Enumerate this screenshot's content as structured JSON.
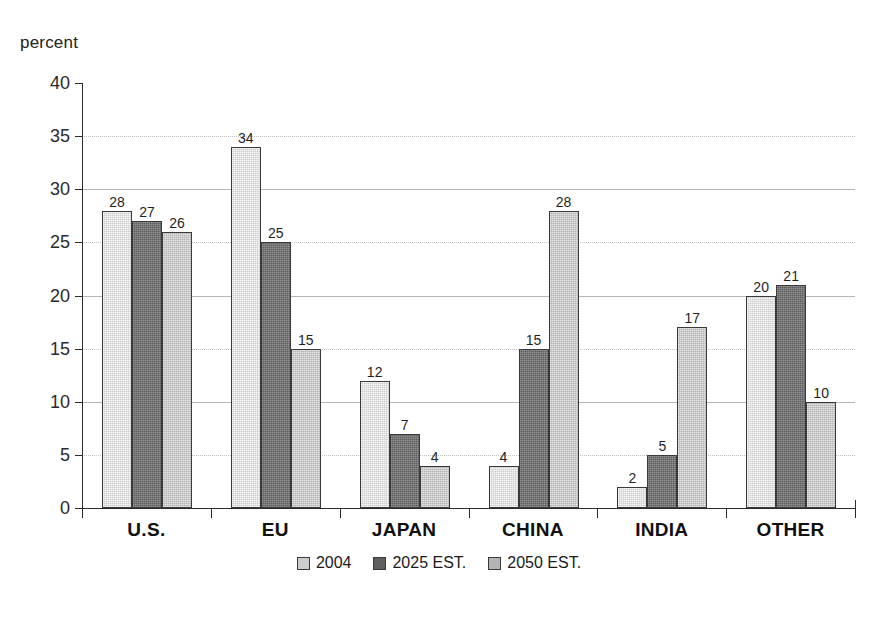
{
  "chart_data": {
    "type": "bar",
    "title": "",
    "subtitle": "",
    "xlabel": "",
    "ylabel": "percent",
    "ylim": [
      0,
      40
    ],
    "ytick_step": 5,
    "yticks": [
      "40",
      "35",
      "30",
      "25",
      "20",
      "15",
      "10",
      "5",
      "0"
    ],
    "grid": true,
    "grid_axis": "y",
    "legend_position": "bottom-center",
    "categories": [
      "U.S.",
      "EU",
      "JAPAN",
      "CHINA",
      "INDIA",
      "OTHER"
    ],
    "series": [
      {
        "name": "2004",
        "color": "#cdcdcd",
        "values": [
          28,
          34,
          12,
          4,
          2,
          20
        ]
      },
      {
        "name": "2025 EST.",
        "color": "#5f5f5f",
        "values": [
          27,
          25,
          7,
          15,
          5,
          21
        ]
      },
      {
        "name": "2050 EST.",
        "color": "#b4b4b4",
        "values": [
          26,
          15,
          4,
          28,
          17,
          10
        ]
      }
    ],
    "bar_labels": [
      [
        "28",
        "27",
        "26"
      ],
      [
        "34",
        "25",
        "15"
      ],
      [
        "12",
        "7",
        "4"
      ],
      [
        "4",
        "15",
        "28"
      ],
      [
        "2",
        "5",
        "17"
      ],
      [
        "20",
        "21",
        "10"
      ]
    ]
  },
  "axis": {
    "y_title": "percent"
  },
  "legend": {
    "items": [
      {
        "label": "2004",
        "color": "#cdcdcd"
      },
      {
        "label": "2025 EST.",
        "color": "#5f5f5f"
      },
      {
        "label": "2050 EST.",
        "color": "#b4b4b4"
      }
    ]
  },
  "artifact": {
    "bottom_smudge": ""
  }
}
